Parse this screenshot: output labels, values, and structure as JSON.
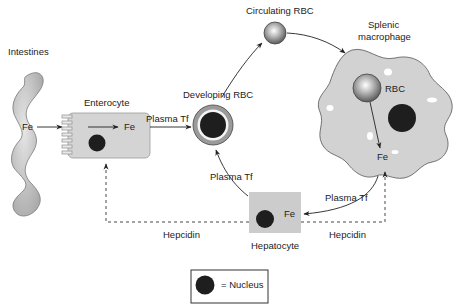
{
  "labels": {
    "intestines": "Intestines",
    "enterocyte": "Enterocyte",
    "fe_intestine": "Fe",
    "fe_enterocyte": "Fe",
    "plasma_tf_1": "Plasma Tf",
    "developing_rbc": "Developing RBC",
    "circulating_rbc": "Circulating RBC",
    "splenic_macrophage_line1": "Splenic",
    "splenic_macrophage_line2": "macrophage",
    "rbc": "RBC",
    "fe_macrophage": "Fe",
    "plasma_tf_2": "Plasma Tf",
    "plasma_tf_3": "Plasma Tf",
    "fe_hepatocyte": "Fe",
    "hepatocyte": "Hepatocyte",
    "hepcidin_left": "Hepcidin",
    "hepcidin_right": "Hepcidin"
  },
  "legend": {
    "nucleus_label": "= Nucleus"
  },
  "colors": {
    "cell_fill": "#cfcfcf",
    "nucleus": "#1e1e1e",
    "line": "#222222"
  }
}
